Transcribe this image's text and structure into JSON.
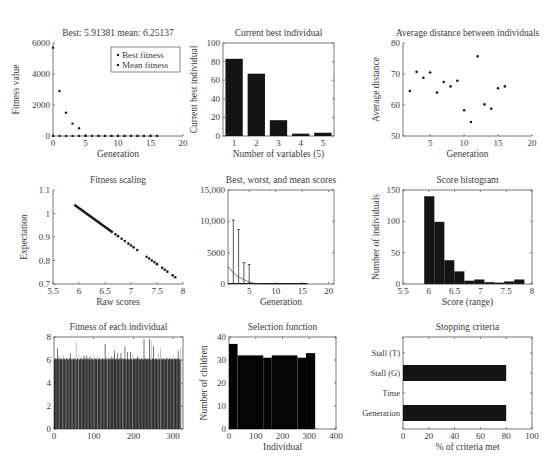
{
  "figure": {
    "width": 559,
    "height": 473,
    "colors": {
      "ink": "#1a1a1a",
      "axis": "#555555",
      "text": "#3a3a3a",
      "bar": "#141414",
      "light_bar": "#9a9a9a"
    }
  },
  "chart_data": [
    {
      "id": "fitness",
      "type": "scatter",
      "title": "Best: 5.91381 mean: 6.25137",
      "xlabel": "Generation",
      "ylabel": "Fitness value",
      "xlim": [
        0,
        20
      ],
      "ylim": [
        0,
        6000
      ],
      "xticks": [
        0,
        5,
        10,
        15,
        20
      ],
      "yticks": [
        0,
        2000,
        4000,
        6000
      ],
      "ytick_labels": [
        "0",
        "2000",
        "4000",
        "6000"
      ],
      "legend": {
        "position": "upper right",
        "entries": [
          "Best fitness",
          "Mean fitness"
        ]
      },
      "series": [
        {
          "name": "Best fitness",
          "x": [
            0,
            1,
            2,
            3,
            4,
            5,
            6,
            7,
            8,
            9,
            10,
            11,
            12,
            13,
            14,
            15,
            16
          ],
          "y": [
            6,
            6,
            6,
            6,
            6,
            6,
            6,
            6,
            6,
            6,
            6,
            6,
            6,
            6,
            6,
            6,
            5.91
          ]
        },
        {
          "name": "Mean fitness",
          "x": [
            0,
            1,
            2,
            3,
            4,
            5,
            6,
            7,
            8,
            9,
            10,
            11,
            12,
            13,
            14,
            15,
            16
          ],
          "y": [
            5700,
            2900,
            1500,
            800,
            500,
            20,
            8,
            7,
            7,
            6.5,
            6.5,
            6.4,
            6.4,
            6.3,
            6.3,
            6.3,
            6.25
          ]
        }
      ],
      "box": [
        53,
        43,
        183,
        136
      ]
    },
    {
      "id": "best-individual",
      "type": "bar",
      "title": "Current best individual",
      "xlabel": "Number of variables (5)",
      "ylabel": "Current best individual",
      "categories": [
        "1",
        "2",
        "3",
        "4",
        "5"
      ],
      "values": [
        83,
        67,
        17,
        2.5,
        3.5
      ],
      "ylim": [
        0,
        100
      ],
      "yticks": [
        0,
        20,
        40,
        60,
        80,
        100
      ],
      "ytick_labels": [
        "0",
        "20",
        "40",
        "60",
        "80",
        "100"
      ],
      "box": [
        223,
        43,
        334,
        136
      ]
    },
    {
      "id": "avg-distance",
      "type": "scatter",
      "title": "Average distance between individuals",
      "xlabel": "Generation",
      "ylabel": "Average distance",
      "xlim": [
        1,
        20
      ],
      "ylim": [
        50,
        80
      ],
      "xticks": [
        5,
        10,
        15,
        20
      ],
      "yticks": [
        50,
        60,
        70,
        80
      ],
      "ytick_labels": [
        "50",
        "60",
        "70",
        "80"
      ],
      "x": [
        2,
        3,
        4,
        5,
        6,
        7,
        8,
        9,
        10,
        11,
        12,
        13,
        14,
        15,
        16
      ],
      "y": [
        64.5,
        70.7,
        68.8,
        70.5,
        64,
        67.4,
        66,
        67.8,
        58.3,
        54.5,
        75.7,
        60.2,
        58.8,
        65.4,
        66
      ],
      "box": [
        403,
        43,
        532,
        136
      ]
    },
    {
      "id": "fitness-scaling",
      "type": "scatter",
      "title": "Fitness scaling",
      "xlabel": "Raw scores",
      "ylabel": "Expectation",
      "xlim": [
        5.5,
        8
      ],
      "ylim": [
        0.7,
        1.1
      ],
      "xticks": [
        5.5,
        6,
        6.5,
        7,
        7.5,
        8
      ],
      "yticks": [
        0.7,
        0.8,
        0.9,
        1,
        1.1
      ],
      "xtick_labels": [
        "5.5",
        "6",
        "6.5",
        "7",
        "7.5",
        "8"
      ],
      "ytick_labels": [
        "0.7",
        "0.8",
        "0.9",
        "1",
        "1.1"
      ],
      "line_fit": {
        "x0": 5.91,
        "y0": 1.037,
        "x1": 7.88,
        "y1": 0.724
      },
      "sparse_x": [
        6.7,
        6.75,
        6.82,
        6.88,
        6.95,
        7.0,
        7.05,
        7.12,
        7.3,
        7.35,
        7.4,
        7.45,
        7.5,
        7.6,
        7.65,
        7.7,
        7.8,
        7.85
      ],
      "box": [
        53,
        190,
        183,
        284
      ]
    },
    {
      "id": "best-worst-mean",
      "type": "line",
      "title": "Best, worst, and mean scores",
      "xlabel": "Generation",
      "ylabel": "",
      "xlim": [
        1,
        21
      ],
      "ylim": [
        0,
        15000
      ],
      "xticks": [
        5,
        10,
        15,
        20
      ],
      "yticks": [
        0,
        5000,
        10000,
        15000
      ],
      "ytick_labels": [
        "0",
        "5000",
        "10,000",
        "15,000"
      ],
      "series": [
        {
          "name": "Worst",
          "x": [
            2,
            3,
            4,
            5
          ],
          "y": [
            10200,
            8700,
            3400,
            3100
          ]
        },
        {
          "name": "Mean",
          "x": [
            1,
            1.5,
            2,
            2.5,
            3,
            3.5,
            4,
            4.5,
            5,
            6,
            8,
            16
          ],
          "y": [
            2800,
            2300,
            1800,
            1450,
            1150,
            900,
            700,
            500,
            300,
            60,
            10,
            6
          ]
        },
        {
          "name": "Best",
          "x": [
            1,
            16
          ],
          "y": [
            6,
            6
          ]
        }
      ],
      "box": [
        228,
        190,
        334,
        284
      ]
    },
    {
      "id": "score-histogram",
      "type": "bar",
      "title": "Score histogram",
      "xlabel": "Score (range)",
      "ylabel": "Number of individuals",
      "xlim": [
        5.5,
        8
      ],
      "ylim": [
        0,
        150
      ],
      "xticks": [
        5.5,
        6,
        6.5,
        7,
        7.5,
        8
      ],
      "yticks": [
        0,
        50,
        100,
        150
      ],
      "xtick_labels": [
        "5.5",
        "6",
        "6.5",
        "7",
        "7.5",
        "8"
      ],
      "ytick_labels": [
        "0",
        "50",
        "100",
        "150"
      ],
      "bin_start": 5.91,
      "bin_width": 0.194,
      "values": [
        140,
        99,
        38,
        20,
        5,
        7,
        3,
        2,
        4,
        7
      ],
      "box": [
        403,
        190,
        532,
        284
      ]
    },
    {
      "id": "individual-fitness",
      "type": "bar",
      "title": "Fitness of each individual",
      "xlabel": "",
      "ylabel": "",
      "xlim": [
        0,
        325
      ],
      "ylim": [
        0,
        8
      ],
      "xticks": [
        0,
        100,
        200,
        300
      ],
      "yticks": [
        0,
        2,
        4,
        6,
        8
      ],
      "ytick_labels": [
        "0",
        "2",
        "4",
        "6",
        "8"
      ],
      "n_individuals": 320,
      "baseline": 6.0,
      "spikes": [
        [
          8,
          7.0
        ],
        [
          12,
          6.4
        ],
        [
          22,
          6.5
        ],
        [
          30,
          6.3
        ],
        [
          40,
          6.6
        ],
        [
          45,
          6.2
        ],
        [
          55,
          7.6
        ],
        [
          62,
          6.4
        ],
        [
          68,
          6.3
        ],
        [
          75,
          6.4
        ],
        [
          82,
          6.4
        ],
        [
          90,
          6.3
        ],
        [
          100,
          6.5
        ],
        [
          110,
          6.3
        ],
        [
          118,
          6.2
        ],
        [
          128,
          7.4
        ],
        [
          135,
          6.2
        ],
        [
          145,
          6.3
        ],
        [
          152,
          6.8
        ],
        [
          160,
          6.6
        ],
        [
          168,
          6.6
        ],
        [
          172,
          6.2
        ],
        [
          178,
          7.2
        ],
        [
          185,
          6.7
        ],
        [
          192,
          6.7
        ],
        [
          198,
          6.6
        ],
        [
          210,
          6.3
        ],
        [
          226,
          7.8
        ],
        [
          240,
          7.8
        ],
        [
          244,
          7.7
        ],
        [
          250,
          7.2
        ],
        [
          262,
          6.6
        ],
        [
          268,
          7.0
        ],
        [
          285,
          6.2
        ],
        [
          300,
          6.3
        ],
        [
          312,
          6.8
        ],
        [
          318,
          7.1
        ]
      ],
      "box": [
        54,
        337,
        183,
        429
      ]
    },
    {
      "id": "selection-function",
      "type": "bar",
      "title": "Selection function",
      "xlabel": "Individual",
      "ylabel": "Number of children",
      "xlim": [
        0,
        400
      ],
      "ylim": [
        0,
        40
      ],
      "xticks": [
        0,
        100,
        200,
        300,
        400
      ],
      "yticks": [
        0,
        10,
        20,
        30,
        40
      ],
      "ytick_labels": [
        "0",
        "10",
        "20",
        "30",
        "40"
      ],
      "steps": [
        [
          0,
          32,
          37
        ],
        [
          32,
          128,
          32
        ],
        [
          128,
          160,
          31
        ],
        [
          160,
          256,
          32
        ],
        [
          256,
          288,
          31
        ],
        [
          288,
          322,
          33
        ]
      ],
      "box": [
        229,
        337,
        336,
        429
      ]
    },
    {
      "id": "stopping-criteria",
      "type": "bar",
      "orientation": "horizontal",
      "title": "Stopping criteria",
      "xlabel": "% of criteria met",
      "ylabel": "",
      "xlim": [
        0,
        100
      ],
      "xticks": [
        0,
        20,
        40,
        60,
        80,
        100
      ],
      "categories": [
        "Stall (T)",
        "Stall (G)",
        "Time",
        "Generation"
      ],
      "values": [
        0,
        80,
        0,
        80
      ],
      "box": [
        403,
        337,
        532,
        429
      ]
    }
  ]
}
